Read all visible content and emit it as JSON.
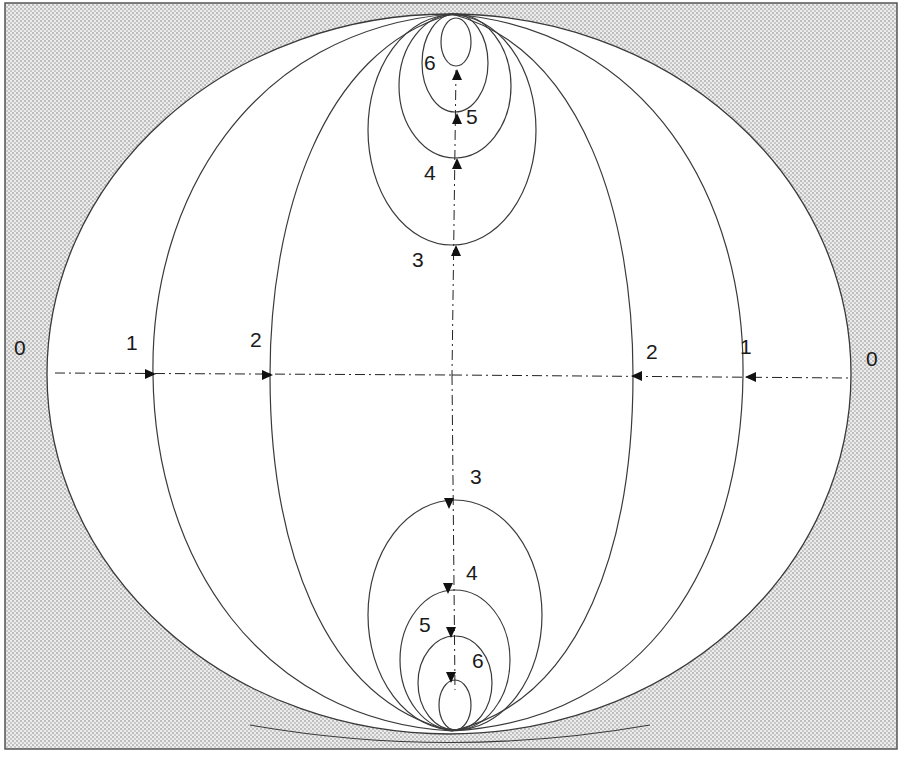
{
  "diagram": {
    "type": "nested-contour-diagram",
    "colors": {
      "background_pattern": "#cfcfcf",
      "background_light": "#f2f2f2",
      "curve_stroke": "#3a3a3a",
      "frame_stroke": "#555555",
      "inside_fill": "#ffffff"
    },
    "labels": {
      "left_0": "0",
      "left_1": "1",
      "left_2": "2",
      "right_2": "2",
      "right_1": "1",
      "right_0": "0",
      "top_3": "3",
      "top_4": "4",
      "top_5": "5",
      "top_6": "6",
      "bottom_3": "3",
      "bottom_4": "4",
      "bottom_5": "5",
      "bottom_6": "6"
    },
    "arrows": {
      "horizontal_left": "arrows point inward (rightward) from level 0 to 1 to 2",
      "horizontal_right": "arrows point inward (leftward) from level 0 to 1 to 2",
      "vertical_up": "arrows point upward through levels 3,4,5,6",
      "vertical_down": "arrows point downward through levels 3,4,5,6"
    }
  }
}
